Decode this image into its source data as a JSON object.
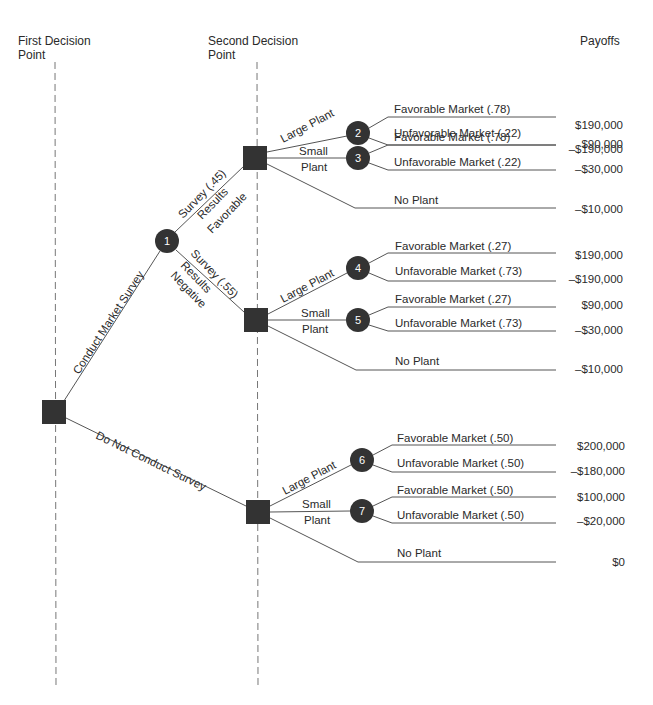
{
  "headers": {
    "first_decision": [
      "First Decision",
      "Point"
    ],
    "second_decision": [
      "Second Decision",
      "Point"
    ],
    "payoffs": "Payoffs"
  },
  "colors": {
    "node": "#333333",
    "line": "#555555",
    "dash": "#777777",
    "text": "#2a2a2a"
  },
  "root": {
    "branches": [
      {
        "label": "Conduct Market Survey"
      },
      {
        "label": "Do Not Conduct Survey"
      }
    ]
  },
  "survey_node": {
    "id": "1",
    "branches": [
      {
        "label": [
          "Survey (.45)",
          "Results",
          "Favorable"
        ]
      },
      {
        "label": [
          "Survey (.55)",
          "Results",
          "Negative"
        ]
      }
    ]
  },
  "decisions": [
    {
      "name": "favorable",
      "large_label": "Large Plant",
      "small_label": [
        "Small",
        "Plant"
      ],
      "no_label": "No Plant",
      "large_node": "2",
      "small_node": "3",
      "outcomes": [
        {
          "label": "Favorable Market (.78)",
          "payoff": "$190,000"
        },
        {
          "label": "Unfavorable Market (.22)",
          "payoff": "–$190,000"
        },
        {
          "label": "Favorable Market (.78)",
          "payoff": "$90,000"
        },
        {
          "label": "Unfavorable Market (.22)",
          "payoff": "–$30,000"
        }
      ],
      "no_payoff": "–$10,000"
    },
    {
      "name": "negative",
      "large_label": "Large Plant",
      "small_label": [
        "Small",
        "Plant"
      ],
      "no_label": "No Plant",
      "large_node": "4",
      "small_node": "5",
      "outcomes": [
        {
          "label": "Favorable Market (.27)",
          "payoff": "$190,000"
        },
        {
          "label": "Unfavorable Market (.73)",
          "payoff": "–$190,000"
        },
        {
          "label": "Favorable Market (.27)",
          "payoff": "$90,000"
        },
        {
          "label": "Unfavorable Market (.73)",
          "payoff": "–$30,000"
        }
      ],
      "no_payoff": "–$10,000"
    },
    {
      "name": "no-survey",
      "large_label": "Large Plant",
      "small_label": [
        "Small",
        "Plant"
      ],
      "no_label": "No Plant",
      "large_node": "6",
      "small_node": "7",
      "outcomes": [
        {
          "label": "Favorable Market (.50)",
          "payoff": "$200,000"
        },
        {
          "label": "Unfavorable Market (.50)",
          "payoff": "–$180,000"
        },
        {
          "label": "Favorable Market (.50)",
          "payoff": "$100,000"
        },
        {
          "label": "Unfavorable Market (.50)",
          "payoff": "–$20,000"
        }
      ],
      "no_payoff": "$0"
    }
  ]
}
